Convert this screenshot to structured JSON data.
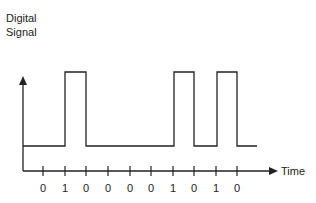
{
  "diagram": {
    "y_axis_label_line1": "Digital",
    "y_axis_label_line2": "Signal",
    "x_axis_label": "Time",
    "bits": [
      "0",
      "1",
      "0",
      "0",
      "0",
      "0",
      "1",
      "0",
      "1",
      "0"
    ],
    "colors": {
      "line": "#222222",
      "background": "#ffffff"
    }
  }
}
